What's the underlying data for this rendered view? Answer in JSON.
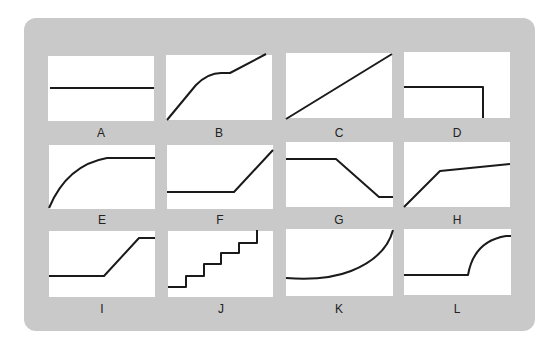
{
  "board_color": "#c9c9c9",
  "line_color": "#1a1a1a",
  "panels": [
    {
      "label": "A",
      "shape": "horizontal line"
    },
    {
      "label": "B",
      "shape": "linear rise, plateau, linear rise"
    },
    {
      "label": "C",
      "shape": "straight line increasing"
    },
    {
      "label": "D",
      "shape": "flat line then vertical drop"
    },
    {
      "label": "E",
      "shape": "concave rise to plateau"
    },
    {
      "label": "F",
      "shape": "flat then linear rise"
    },
    {
      "label": "G",
      "shape": "flat, linear decrease, flat"
    },
    {
      "label": "H",
      "shape": "steep rise then gentle rise"
    },
    {
      "label": "I",
      "shape": "flat, linear rise, flat"
    },
    {
      "label": "J",
      "shape": "staircase steps"
    },
    {
      "label": "K",
      "shape": "exponential growth"
    },
    {
      "label": "L",
      "shape": "flat then concave rise"
    }
  ]
}
